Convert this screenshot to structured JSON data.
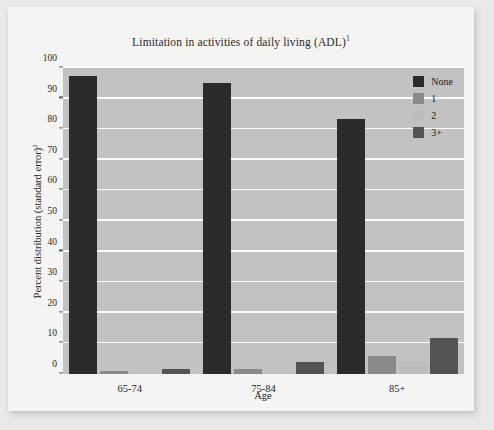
{
  "chart_data": {
    "type": "bar",
    "title": "Limitation in activities of daily living (ADL)",
    "title_superscript": "1",
    "xlabel": "Age",
    "ylabel": "Percent distribution (standard error)",
    "ylabel_superscript": "2",
    "categories": [
      "65-74",
      "75-84",
      "85+"
    ],
    "ylim": [
      0,
      100
    ],
    "yticks": [
      0,
      10,
      20,
      30,
      40,
      50,
      60,
      70,
      80,
      90,
      100
    ],
    "ytick_labels": [
      "0",
      "10",
      "20",
      "30",
      "40",
      "50",
      "60",
      "70",
      "80",
      "90",
      "100"
    ],
    "grid": true,
    "legend_position": "top-right",
    "series": [
      {
        "name": "None",
        "color": "#2b2b2b",
        "values": [
          97.5,
          95.0,
          83.5
        ]
      },
      {
        "name": "1",
        "color": "#8a8a8a",
        "values": [
          1.0,
          1.5,
          6.0
        ]
      },
      {
        "name": "2",
        "color": "#bcbcbc",
        "values": [
          0.3,
          0.4,
          4.0
        ]
      },
      {
        "name": "3+",
        "color": "#545454",
        "values": [
          1.5,
          4.0,
          11.8
        ]
      }
    ]
  },
  "style": {
    "page_background": "#e9e9e9",
    "card_background": "#f4f4f2",
    "plot_background": "#c2c2c2",
    "gridline_color": "#fbfbfb",
    "text_color": "#242424"
  }
}
